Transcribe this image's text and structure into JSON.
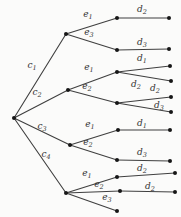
{
  "diagram": {
    "type": "probability-tree",
    "background": "#fbfbfa",
    "edge_color": "#3f3f3f",
    "node_color": "#161616",
    "label_color": "#333333",
    "canvas": {
      "width": 181,
      "height": 217
    },
    "nodes": [
      {
        "id": "root",
        "x": 14,
        "y": 118
      },
      {
        "id": "nc1",
        "x": 66,
        "y": 34
      },
      {
        "id": "nc2",
        "x": 68,
        "y": 90
      },
      {
        "id": "nc3",
        "x": 70,
        "y": 145
      },
      {
        "id": "nc4",
        "x": 66,
        "y": 193
      },
      {
        "id": "n1a",
        "x": 117,
        "y": 18
      },
      {
        "id": "l1a",
        "x": 169,
        "y": 18
      },
      {
        "id": "n1b",
        "x": 117,
        "y": 50
      },
      {
        "id": "l1b",
        "x": 169,
        "y": 49
      },
      {
        "id": "n2a",
        "x": 117,
        "y": 72
      },
      {
        "id": "l2a",
        "x": 170,
        "y": 66
      },
      {
        "id": "l2b",
        "x": 171,
        "y": 81
      },
      {
        "id": "n2b",
        "x": 117,
        "y": 103
      },
      {
        "id": "l2c",
        "x": 171,
        "y": 97
      },
      {
        "id": "l2d",
        "x": 171,
        "y": 112
      },
      {
        "id": "n3a",
        "x": 118,
        "y": 130
      },
      {
        "id": "l3a",
        "x": 170,
        "y": 130
      },
      {
        "id": "n3b",
        "x": 117,
        "y": 160
      },
      {
        "id": "l3b",
        "x": 170,
        "y": 161
      },
      {
        "id": "n4a",
        "x": 117,
        "y": 177
      },
      {
        "id": "l4a",
        "x": 175,
        "y": 173
      },
      {
        "id": "n4b",
        "x": 120,
        "y": 191
      },
      {
        "id": "l4b",
        "x": 175,
        "y": 192
      },
      {
        "id": "n4c",
        "x": 117,
        "y": 211
      }
    ],
    "edges": [
      {
        "id": "c1",
        "from": "root",
        "to": "nc1",
        "base": "c",
        "sub": "1",
        "lx": 32,
        "ly": 68
      },
      {
        "id": "c2",
        "from": "root",
        "to": "nc2",
        "base": "c",
        "sub": "2",
        "lx": 37,
        "ly": 95
      },
      {
        "id": "c3",
        "from": "root",
        "to": "nc3",
        "base": "c",
        "sub": "3",
        "lx": 42,
        "ly": 129
      },
      {
        "id": "c4",
        "from": "root",
        "to": "nc4",
        "base": "c",
        "sub": "4",
        "lx": 46,
        "ly": 157
      },
      {
        "id": "g1-e1",
        "from": "nc1",
        "to": "n1a",
        "base": "e",
        "sub": "1",
        "lx": 88,
        "ly": 17
      },
      {
        "id": "g1-e3",
        "from": "nc1",
        "to": "n1b",
        "base": "e",
        "sub": "3",
        "lx": 89,
        "ly": 35
      },
      {
        "id": "g1-d2",
        "from": "n1a",
        "to": "l1a",
        "base": "d",
        "sub": "2",
        "lx": 142,
        "ly": 12
      },
      {
        "id": "g1-d3",
        "from": "n1b",
        "to": "l1b",
        "base": "d",
        "sub": "3",
        "lx": 142,
        "ly": 45
      },
      {
        "id": "g2-e1",
        "from": "nc2",
        "to": "n2a",
        "base": "e",
        "sub": "1",
        "lx": 89,
        "ly": 70
      },
      {
        "id": "g2-e2",
        "from": "nc2",
        "to": "n2b",
        "base": "e",
        "sub": "2",
        "lx": 87,
        "ly": 89
      },
      {
        "id": "g2-d1",
        "from": "n2a",
        "to": "l2a",
        "base": "d",
        "sub": "1",
        "lx": 142,
        "ly": 61
      },
      {
        "id": "g2-d2a",
        "from": "n2a",
        "to": "l2b",
        "base": "d",
        "sub": "2",
        "lx": 136,
        "ly": 87
      },
      {
        "id": "g2-d2b",
        "from": "n2b",
        "to": "l2c",
        "base": "d",
        "sub": "2",
        "lx": 155,
        "ly": 91
      },
      {
        "id": "g2-d3",
        "from": "n2b",
        "to": "l2d",
        "base": "d",
        "sub": "3",
        "lx": 159,
        "ly": 108
      },
      {
        "id": "g3-e1",
        "from": "nc3",
        "to": "n3a",
        "base": "e",
        "sub": "1",
        "lx": 90,
        "ly": 127
      },
      {
        "id": "g3-e2",
        "from": "nc3",
        "to": "n3b",
        "base": "e",
        "sub": "2",
        "lx": 88,
        "ly": 145
      },
      {
        "id": "g3-d1",
        "from": "n3a",
        "to": "l3a",
        "base": "d",
        "sub": "1",
        "lx": 142,
        "ly": 126
      },
      {
        "id": "g3-d3",
        "from": "n3b",
        "to": "l3b",
        "base": "d",
        "sub": "3",
        "lx": 142,
        "ly": 155
      },
      {
        "id": "g4-e1",
        "from": "nc4",
        "to": "n4a",
        "base": "e",
        "sub": "1",
        "lx": 87,
        "ly": 176
      },
      {
        "id": "g4-e2",
        "from": "nc4",
        "to": "n4b",
        "base": "e",
        "sub": "2",
        "lx": 99,
        "ly": 187
      },
      {
        "id": "g4-e3",
        "from": "nc4",
        "to": "n4c",
        "base": "e",
        "sub": "3",
        "lx": 107,
        "ly": 200
      },
      {
        "id": "g4-d2a",
        "from": "n4a",
        "to": "l4a",
        "base": "d",
        "sub": "2",
        "lx": 142,
        "ly": 171
      },
      {
        "id": "g4-d2b",
        "from": "n4b",
        "to": "l4b",
        "base": "d",
        "sub": "2",
        "lx": 150,
        "ly": 189
      }
    ]
  }
}
